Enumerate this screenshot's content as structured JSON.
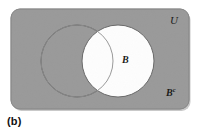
{
  "figure": {
    "caption": "(b)",
    "labels": {
      "universe": "U",
      "set_b": "B",
      "complement_base": "B",
      "complement_superscript": "c"
    },
    "colors": {
      "background": "#ffffff",
      "universe_fill": "#9a9a9a",
      "universe_stroke": "#8a8a8a",
      "shaded_region": "#9a9a9a",
      "set_b_fill": "#fdfdfd",
      "circle_stroke": "#5a5a5a",
      "text": "#1a1a1a"
    },
    "geometry": {
      "rectangle": {
        "x": 11,
        "y": 9,
        "width": 178,
        "height": 100,
        "corner_radius": 9
      },
      "circle_a": {
        "cx": 77,
        "cy": 61,
        "r": 36
      },
      "circle_b": {
        "cx": 118,
        "cy": 61,
        "r": 36
      }
    },
    "shaded_set": "B complement",
    "unshaded_set": "B"
  }
}
